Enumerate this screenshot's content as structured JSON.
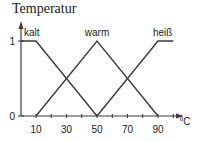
{
  "chart_data": {
    "type": "line",
    "title": "Temperatur",
    "xlabel": "°C",
    "ylabel": "",
    "xlim": [
      0,
      100
    ],
    "ylim": [
      0,
      1
    ],
    "grid": false,
    "legend": "inline labels above each series peak",
    "xticks": [
      10,
      20,
      30,
      40,
      50,
      60,
      70,
      80,
      90,
      100
    ],
    "xtick_labels": [
      "10",
      "30",
      "50",
      "70",
      "90"
    ],
    "xtick_label_values": [
      10,
      30,
      50,
      70,
      90
    ],
    "yticks": [
      0,
      1
    ],
    "ytick_labels": [
      "0",
      "1"
    ],
    "series": [
      {
        "name": "kalt",
        "x": [
          0,
          10,
          50
        ],
        "values": [
          1,
          1,
          0
        ]
      },
      {
        "name": "warm",
        "x": [
          10,
          50,
          90
        ],
        "values": [
          0,
          1,
          0
        ]
      },
      {
        "name": "heiß",
        "x": [
          50,
          90,
          100
        ],
        "values": [
          0,
          1,
          1
        ]
      }
    ],
    "colors": {
      "line": "#3a3a3a",
      "axis": "#3a3a3a",
      "text": "#1a1a1a"
    }
  }
}
